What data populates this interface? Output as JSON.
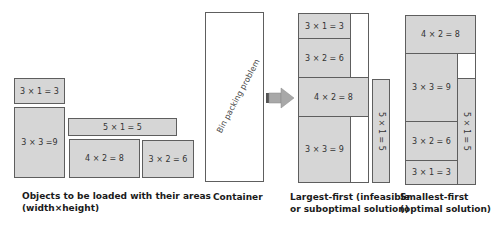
{
  "objects": {
    "caption_line1": "Objects to be loaded with their areas",
    "caption_line2": "(width×height)",
    "items": [
      {
        "label": "3 × 1 = 3"
      },
      {
        "label": "3 × 3 =9"
      },
      {
        "label": "5 × 1 = 5"
      },
      {
        "label": "4 × 2 = 8"
      },
      {
        "label": "3 × 2 = 6"
      }
    ]
  },
  "container": {
    "caption": "Container",
    "label": "Bin packing problem"
  },
  "largest_first": {
    "caption_line1": "Largest-first (infeasible",
    "caption_line2": "or suboptimal solution)",
    "items": [
      {
        "label": "3 × 1 = 3"
      },
      {
        "label": "3 × 2 = 6"
      },
      {
        "label": "4 × 2 = 8"
      },
      {
        "label": "3 × 3 = 9"
      },
      {
        "label": "5 × 1 = 5"
      }
    ]
  },
  "smallest_first": {
    "caption_line1": "Smallest-first",
    "caption_line2": "(optimal solution)",
    "items": [
      {
        "label": "4 × 2 = 8"
      },
      {
        "label": "3 × 3 = 9"
      },
      {
        "label": "3 × 2 = 6"
      },
      {
        "label": "3 × 1 = 3"
      },
      {
        "label": "5 × 1 = 5"
      }
    ]
  },
  "colors": {
    "box_fill": "#d6d6d6",
    "box_border": "#5e5e5e",
    "arrow": "#a8a8a8"
  }
}
